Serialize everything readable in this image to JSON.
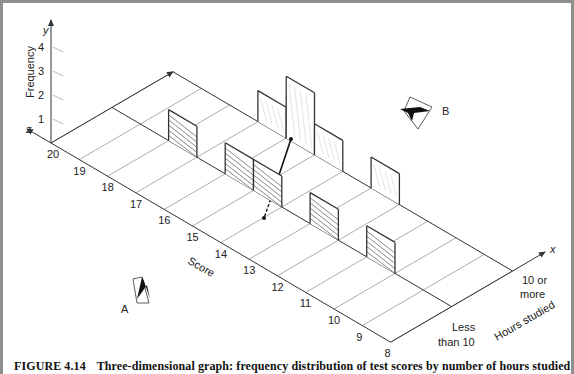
{
  "figure": {
    "number": "FIGURE 4.14",
    "caption": "Three-dimensional graph: frequency distribution of test scores by number of hours studied"
  },
  "axes": {
    "y_letter": "y",
    "z_letter": "z",
    "x_letter": "x",
    "y_label": "Frequency",
    "z_label": "Score",
    "x_label": "Hours studied"
  },
  "viewpoints": {
    "a": "A",
    "b": "B"
  },
  "colors": {
    "line": "#333333",
    "grid": "#8a8a8a",
    "hatch": "#555555",
    "frame": "#8e8e8e"
  },
  "chart_data": {
    "type": "bar",
    "subtype": "3d-frequency-distribution",
    "title": "Three-dimensional graph: frequency distribution of test scores by number of hours studied",
    "xlabel": "Hours studied",
    "ylabel": "Frequency",
    "zlabel": "Score",
    "y_ticks": [
      1,
      2,
      3,
      4
    ],
    "ylim": [
      0,
      4
    ],
    "z_ticks": [
      20,
      19,
      18,
      17,
      16,
      15,
      14,
      13,
      12,
      11,
      10,
      9,
      8
    ],
    "x_categories": [
      "Less than 10",
      "10 or more"
    ],
    "x_category_lines": [
      "Less",
      "than 10",
      "10 or",
      "more"
    ],
    "series": [
      {
        "name": "Less than 10",
        "style": "hatched",
        "scores": [
          18,
          16,
          15,
          13,
          11
        ],
        "values": [
          1,
          1,
          1,
          1,
          1
        ]
      },
      {
        "name": "10 or more",
        "style": "light",
        "scores": [
          17,
          16,
          15,
          13
        ],
        "values": [
          1,
          2,
          1,
          1
        ]
      }
    ],
    "annotations": [
      "A",
      "B"
    ]
  }
}
